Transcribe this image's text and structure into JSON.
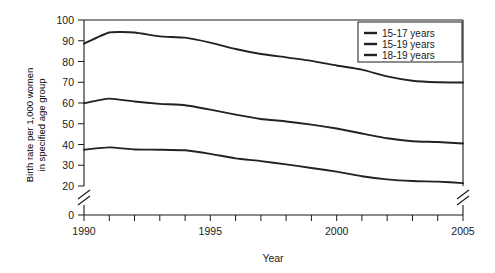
{
  "chart_data": {
    "type": "line",
    "title": "",
    "xlabel": "Year",
    "ylabel": "Birth rate per 1,000 women in specified age group",
    "x": [
      1990,
      1991,
      1992,
      1993,
      1994,
      1995,
      1996,
      1997,
      1998,
      1999,
      2000,
      2001,
      2002,
      2003,
      2004,
      2005
    ],
    "xlim": [
      1990,
      2005
    ],
    "ylim": [
      0,
      100
    ],
    "y_ticks": [
      0,
      20,
      30,
      40,
      50,
      60,
      70,
      80,
      90,
      100
    ],
    "y_tick_labels": [
      "0",
      "20",
      "30",
      "40",
      "50",
      "60",
      "70",
      "80",
      "90",
      "100"
    ],
    "x_ticks": [
      1990,
      1991,
      1992,
      1993,
      1994,
      1995,
      1996,
      1997,
      1998,
      1999,
      2000,
      2001,
      2002,
      2003,
      2004,
      2005
    ],
    "x_tick_labels_shown": [
      "1990",
      "1995",
      "2000",
      "2005"
    ],
    "axis_break": {
      "present": true,
      "between": [
        0,
        20
      ],
      "note": "y-axis broken between 0 and 20; right frame also broken"
    },
    "grid": false,
    "legend_position": "upper-right",
    "series": [
      {
        "name": "15-17 years",
        "color": "#222222",
        "values": [
          37.5,
          38.6,
          37.6,
          37.5,
          37.2,
          35.5,
          33.3,
          32.0,
          30.4,
          28.7,
          26.9,
          24.7,
          23.2,
          22.4,
          22.1,
          21.4
        ]
      },
      {
        "name": "15-19 years",
        "color": "#222222",
        "values": [
          59.9,
          62.1,
          60.7,
          59.6,
          58.9,
          56.8,
          54.4,
          52.3,
          51.1,
          49.6,
          47.7,
          45.3,
          43.0,
          41.6,
          41.2,
          40.5
        ]
      },
      {
        "name": "18-19 years",
        "color": "#222222",
        "values": [
          88.6,
          94.0,
          94.0,
          92.1,
          91.5,
          89.1,
          86.0,
          83.6,
          82.0,
          80.3,
          78.1,
          76.1,
          72.8,
          70.7,
          70.0,
          69.9
        ]
      }
    ]
  },
  "legend": {
    "entries": [
      {
        "label": "15-17 years"
      },
      {
        "label": "15-19 years"
      },
      {
        "label": "18-19 years"
      }
    ]
  },
  "axes": {
    "x_title": "Year",
    "y_title_line1": "Birth rate per 1,000 women",
    "y_title_line2": "in specified age group"
  }
}
